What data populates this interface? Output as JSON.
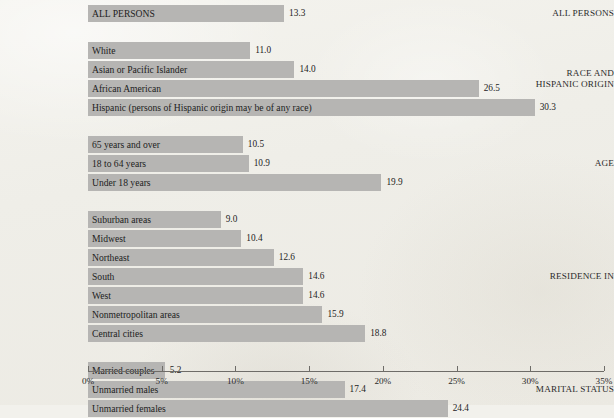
{
  "chart_data": {
    "type": "bar",
    "orientation": "horizontal",
    "title": "",
    "xlabel": "",
    "ylabel": "",
    "xlim": [
      0,
      35
    ],
    "x_tick_labels": [
      "0%",
      "5%",
      "10%",
      "15%",
      "20%",
      "25%",
      "30%",
      "35%"
    ],
    "x_ticks": [
      0,
      5,
      10,
      15,
      20,
      25,
      30,
      35
    ],
    "grid": false,
    "legend": false,
    "value_suffix": "%",
    "bar_color": "#b6b5b3",
    "axis_color": "#6e6c68",
    "background_color": "#f2f1ec",
    "groups": [
      {
        "group_label": "ALL PERSONS",
        "categories": [
          "ALL PERSONS"
        ],
        "values": [
          13.3
        ],
        "value_labels": [
          "13.3"
        ]
      },
      {
        "group_label": "RACE AND\nHISPANIC ORIGIN",
        "categories": [
          "White",
          "Asian or Pacific Islander",
          "African American",
          "Hispanic (persons of Hispanic origin may be of any race)"
        ],
        "values": [
          11.0,
          14.0,
          26.5,
          30.3
        ],
        "value_labels": [
          "11.0",
          "14.0",
          "26.5",
          "30.3"
        ]
      },
      {
        "group_label": "AGE",
        "categories": [
          "65 years and over",
          "18 to 64 years",
          "Under 18 years"
        ],
        "values": [
          10.5,
          10.9,
          19.9
        ],
        "value_labels": [
          "10.5",
          "10.9",
          "19.9"
        ]
      },
      {
        "group_label": "RESIDENCE IN",
        "categories": [
          "Suburban areas",
          "Midwest",
          "Northeast",
          "South",
          "West",
          "Nonmetropolitan areas",
          "Central cities"
        ],
        "values": [
          9.0,
          10.4,
          12.6,
          14.6,
          14.6,
          15.9,
          18.8
        ],
        "value_labels": [
          "9.0",
          "10.4",
          "12.6",
          "14.6",
          "14.6",
          "15.9",
          "18.8"
        ]
      },
      {
        "group_label": "MARITAL STATUS",
        "categories": [
          "Married couples",
          "Unmarried males",
          "Unmarried females"
        ],
        "values": [
          5.2,
          17.4,
          24.4
        ],
        "value_labels": [
          "5.2",
          "17.4",
          "24.4"
        ]
      }
    ]
  },
  "layout": {
    "plot_left_px": 88,
    "plot_width_px": 516,
    "bar_height_px": 17,
    "bar_gap_px": 2,
    "group_gap_px": 18,
    "first_bar_top_px": 5,
    "axis_top_px": 371
  }
}
